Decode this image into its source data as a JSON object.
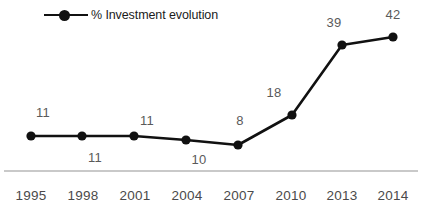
{
  "chart_data": {
    "type": "line",
    "title": "",
    "subtitle": "",
    "xlabel": "",
    "ylabel": "",
    "grid": false,
    "legend_position": "top-left",
    "categories": [
      "1995",
      "1998",
      "2001",
      "2004",
      "2007",
      "2010",
      "2013",
      "2014"
    ],
    "series": [
      {
        "name": "% Investment evolution",
        "values": [
          11,
          11,
          11,
          10,
          8,
          18,
          39,
          42
        ],
        "color": "#111111",
        "marker": "circle",
        "data_labels": [
          "11",
          "11",
          "11",
          "10",
          "8",
          "18",
          "39",
          "42"
        ],
        "data_label_positions": [
          "above",
          "below",
          "above",
          "below",
          "above",
          "above",
          "above",
          "above"
        ]
      }
    ],
    "ylim": [
      0,
      48
    ],
    "axis_line_color": "#c9c9c9"
  },
  "legend": {
    "entries": [
      {
        "label": "% Investment evolution",
        "color": "#111111"
      }
    ]
  },
  "axis": {
    "tick_labels": [
      "1995",
      "1998",
      "2001",
      "2004",
      "2007",
      "2010",
      "2013",
      "2014"
    ]
  },
  "points": [
    {
      "x": 31,
      "y": 136,
      "label": "11",
      "lx": 43,
      "ly": 112
    },
    {
      "x": 82,
      "y": 136,
      "label": "11",
      "lx": 95,
      "ly": 157
    },
    {
      "x": 134,
      "y": 136,
      "label": "11",
      "lx": 147,
      "ly": 120
    },
    {
      "x": 186,
      "y": 140,
      "label": "10",
      "lx": 199,
      "ly": 159
    },
    {
      "x": 238,
      "y": 145,
      "label": "8",
      "lx": 240,
      "ly": 120
    },
    {
      "x": 292,
      "y": 115,
      "label": "18",
      "lx": 274,
      "ly": 92
    },
    {
      "x": 342,
      "y": 45,
      "label": "39",
      "lx": 334,
      "ly": 22
    },
    {
      "x": 393,
      "y": 37,
      "label": "42",
      "lx": 393,
      "ly": 14
    }
  ],
  "tick_positions": [
    {
      "x": 31,
      "y": 195
    },
    {
      "x": 83,
      "y": 195
    },
    {
      "x": 135,
      "y": 195
    },
    {
      "x": 187,
      "y": 195
    },
    {
      "x": 239,
      "y": 195
    },
    {
      "x": 291,
      "y": 195
    },
    {
      "x": 342,
      "y": 195
    },
    {
      "x": 393,
      "y": 195
    }
  ]
}
